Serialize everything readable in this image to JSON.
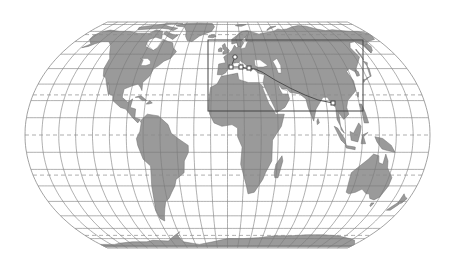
{
  "map": {
    "title": "World map (Equal Earth-like projection) with highlighted region and route",
    "projection": "pseudocylindrical",
    "colors": {
      "background": "#ffffff",
      "ocean": "#ffffff",
      "land": "#9a9a9a",
      "land_stroke": "#6f6f6f",
      "graticule": "#7a7a7a",
      "special_parallels": "#8a8a8a",
      "outline": "#8a8a8a",
      "route": "#444444",
      "box": "#444444"
    },
    "graticule": {
      "meridian_step_deg": 15,
      "parallel_step_deg": 10,
      "dashed_parallels": [
        "Arctic Circle",
        "Tropic of Cancer",
        "Equator",
        "Tropic of Capricorn",
        "Antarctic Circle"
      ]
    },
    "highlight_box": {
      "label": "region-of-interest",
      "lon_min": -18,
      "lon_max": 142,
      "lat_min": 14,
      "lat_max": 62
    },
    "route": {
      "label": "route",
      "stops": [
        {
          "name": "stop-1",
          "marker": "circle",
          "lon": 2,
          "lat": 48
        },
        {
          "name": "stop-2",
          "marker": "square",
          "lon": -2,
          "lat": 41
        },
        {
          "name": "stop-3",
          "marker": "square",
          "lon": 12,
          "lat": 41
        },
        {
          "name": "stop-4",
          "marker": "square",
          "lon": 20,
          "lat": 40
        },
        {
          "name": "stop-5",
          "marker": "square",
          "lon": 100,
          "lat": 16
        }
      ]
    }
  }
}
